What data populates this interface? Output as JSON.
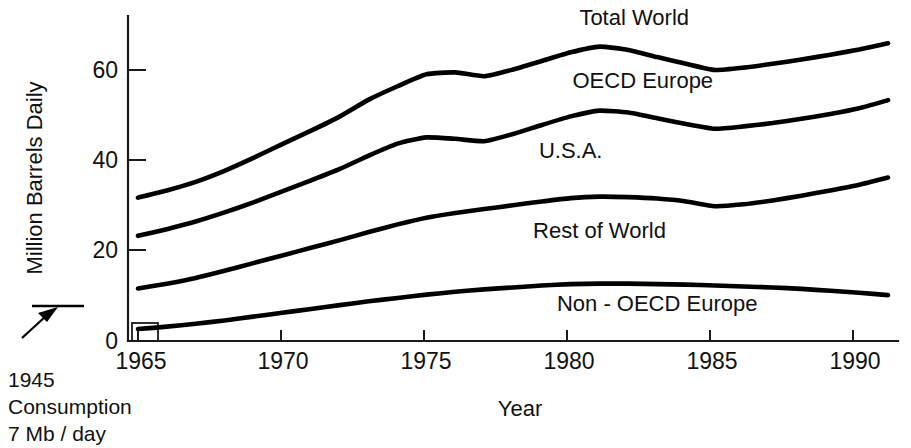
{
  "chart_data": {
    "type": "line",
    "title": "",
    "xlabel": "Year",
    "ylabel": "Million Barrels Daily",
    "xlim": [
      1965,
      1991
    ],
    "ylim": [
      0,
      68
    ],
    "grid": false,
    "legend_position": "inline-labels",
    "x_ticks": [
      "1965",
      "1970",
      "1975",
      "1980",
      "1985",
      "1990"
    ],
    "x_tick_values": [
      1965,
      1970,
      1975,
      1980,
      1985,
      1990
    ],
    "y_ticks": [
      "0",
      "20",
      "40",
      "60"
    ],
    "y_tick_values": [
      0,
      20,
      40,
      60
    ],
    "x": [
      1965,
      1966,
      1967,
      1968,
      1969,
      1970,
      1971,
      1972,
      1973,
      1974,
      1975,
      1976,
      1977,
      1978,
      1979,
      1980,
      1981,
      1982,
      1983,
      1984,
      1985,
      1986,
      1987,
      1988,
      1989,
      1990,
      1991
    ],
    "series": [
      {
        "name": "Total World",
        "label": "Total World",
        "values": [
          30.0,
          31.5,
          33.3,
          35.6,
          38.3,
          41.2,
          44.0,
          47.0,
          50.5,
          53.3,
          55.8,
          56.2,
          55.4,
          56.8,
          58.6,
          60.4,
          61.6,
          60.9,
          59.4,
          58.0,
          56.7,
          57.2,
          58.0,
          58.9,
          59.9,
          61.0,
          62.3
        ]
      },
      {
        "name": "OECD Europe",
        "label": "OECD Europe",
        "values": [
          22.0,
          23.4,
          25.0,
          26.9,
          29.0,
          31.3,
          33.6,
          36.0,
          38.8,
          41.3,
          42.6,
          42.3,
          41.8,
          43.3,
          45.2,
          47.0,
          48.2,
          47.8,
          46.6,
          45.4,
          44.4,
          44.9,
          45.6,
          46.5,
          47.5,
          48.7,
          50.4
        ]
      },
      {
        "name": "U.S.A.",
        "label": "U.S.A.",
        "values": [
          11.0,
          12.0,
          13.2,
          14.7,
          16.3,
          17.9,
          19.5,
          21.1,
          22.8,
          24.4,
          25.8,
          26.8,
          27.6,
          28.4,
          29.2,
          29.9,
          30.2,
          30.1,
          29.8,
          29.2,
          28.2,
          28.6,
          29.4,
          30.4,
          31.5,
          32.7,
          34.2
        ]
      },
      {
        "name": "Rest of World",
        "label": "Rest of World",
        "values": [
          2.5,
          3.0,
          3.6,
          4.3,
          5.1,
          5.9,
          6.7,
          7.5,
          8.3,
          9.0,
          9.7,
          10.3,
          10.8,
          11.2,
          11.6,
          11.9,
          12.0,
          12.0,
          11.9,
          11.8,
          11.6,
          11.4,
          11.2,
          10.9,
          10.5,
          10.1,
          9.6
        ]
      }
    ],
    "inline_labels": [
      {
        "text": "Total World",
        "x": 1982.2,
        "y": 66.2
      },
      {
        "text": "OECD Europe",
        "x": 1982.5,
        "y": 53.0
      },
      {
        "text": "U.S.A.",
        "x": 1980.0,
        "y": 38.2
      },
      {
        "text": "Rest of World",
        "x": 1981.0,
        "y": 21.5
      },
      {
        "text": "Non - OECD Europe",
        "x": 1983.0,
        "y": 6.2
      }
    ],
    "annotation": {
      "lines": [
        "1945",
        "Consumption",
        "7 Mb / day"
      ],
      "value_mb_per_day": 7,
      "year": 1945,
      "marker": "horizontal-rule-with-arrow"
    },
    "colors": {
      "line": "#000000",
      "axis": "#1a1a1a",
      "background": "#ffffff",
      "text": "#111111"
    }
  }
}
